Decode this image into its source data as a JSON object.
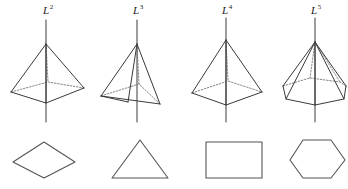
{
  "figure": {
    "width": 348,
    "height": 189,
    "background": "#ffffff",
    "stroke_color": "#3a3a3a",
    "hidden_stroke_color": "#6a6a6a",
    "polygon_stroke_color": "#555555",
    "columns": [
      {
        "id": "col-1",
        "label_base": "L",
        "label_exponent": "2",
        "label_x": 43,
        "label_y": 4,
        "solid": {
          "apex": [
            46,
            44
          ],
          "axis_top": [
            46,
            20
          ],
          "axis_bottom": [
            46,
            122
          ],
          "base_front": [
            [
              11,
              92
            ],
            [
              46,
              103
            ],
            [
              84,
              88
            ]
          ],
          "base_back_dashed": [
            [
              11,
              92
            ],
            [
              48,
              82
            ],
            [
              84,
              88
            ]
          ],
          "apex_edges": [
            [
              11,
              92
            ],
            [
              46,
              103
            ],
            [
              84,
              88
            ],
            [
              48,
              82
            ]
          ],
          "hidden_apex_edges": [
            [
              48,
              82
            ]
          ]
        },
        "polygon": {
          "name": "rhombus",
          "points": "13,162 44,142 75,162 44,178"
        }
      },
      {
        "id": "col-2",
        "label_base": "L",
        "label_exponent": "3",
        "label_x": 133,
        "label_y": 4,
        "solid": {
          "apex": [
            137,
            44
          ],
          "axis_top": [
            137,
            20
          ],
          "axis_bottom": [
            137,
            122
          ],
          "base_front": [
            [
              101,
              96
            ],
            [
              160,
              104
            ]
          ],
          "base_back_dashed": [
            [
              101,
              96
            ],
            [
              139,
              84
            ],
            [
              160,
              104
            ]
          ],
          "apex_edges": [
            [
              101,
              96
            ],
            [
              160,
              104
            ],
            [
              139,
              84
            ]
          ],
          "hidden_apex_edges": [
            [
              139,
              84
            ]
          ]
        },
        "polygon": {
          "name": "triangle",
          "points": "140,140 168,178 112,178"
        }
      },
      {
        "id": "col-3",
        "label_base": "L",
        "label_exponent": "4",
        "label_x": 222,
        "label_y": 4,
        "solid": {
          "apex": [
            226,
            40
          ],
          "axis_top": [
            226,
            18
          ],
          "axis_bottom": [
            226,
            122
          ],
          "base_front": [
            [
              192,
              93
            ],
            [
              226,
              105
            ],
            [
              262,
              92
            ]
          ],
          "base_back_dashed": [
            [
              192,
              93
            ],
            [
              228,
              81
            ],
            [
              262,
              92
            ]
          ],
          "apex_edges": [
            [
              192,
              93
            ],
            [
              226,
              105
            ],
            [
              262,
              92
            ],
            [
              228,
              81
            ]
          ],
          "hidden_apex_edges": [
            [
              228,
              81
            ]
          ]
        },
        "polygon": {
          "name": "square",
          "points": "206,142 262,142 262,178 206,178"
        }
      },
      {
        "id": "col-4",
        "label_base": "L",
        "label_exponent": "5",
        "label_x": 311,
        "label_y": 4,
        "solid": {
          "apex": [
            315,
            42
          ],
          "axis_top": [
            315,
            18
          ],
          "axis_bottom": [
            315,
            122
          ],
          "base_front": [
            [
              283,
              86
            ],
            [
              286,
              99
            ],
            [
              315,
              105
            ],
            [
              344,
              99
            ],
            [
              346,
              86
            ]
          ],
          "base_back_dashed": [
            [
              283,
              86
            ],
            [
              310,
              78
            ],
            [
              340,
              82
            ],
            [
              346,
              86
            ]
          ],
          "apex_edges": [
            [
              283,
              86
            ],
            [
              286,
              99
            ],
            [
              315,
              105
            ],
            [
              344,
              99
            ],
            [
              346,
              86
            ]
          ],
          "hidden_apex_edges": [
            [
              310,
              78
            ],
            [
              340,
              82
            ]
          ]
        },
        "polygon": {
          "name": "hexagon",
          "points": "290,160 303,140 331,140 345,160 331,178 303,178"
        }
      }
    ]
  }
}
